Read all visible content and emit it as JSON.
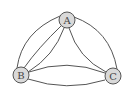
{
  "diagram": {
    "type": "multigraph",
    "nodes": [
      {
        "id": "A",
        "label": "A",
        "x": 67,
        "y": 20
      },
      {
        "id": "B",
        "label": "B",
        "x": 21,
        "y": 75
      },
      {
        "id": "C",
        "label": "C",
        "x": 113,
        "y": 76
      }
    ],
    "edges": [
      {
        "from": "A",
        "to": "B",
        "count": 3
      },
      {
        "from": "A",
        "to": "C",
        "count": 2
      },
      {
        "from": "B",
        "to": "C",
        "count": 2
      }
    ],
    "colors": {
      "node_fill": "#d9d9d9",
      "stroke": "#555555",
      "background": "#ffffff"
    }
  }
}
